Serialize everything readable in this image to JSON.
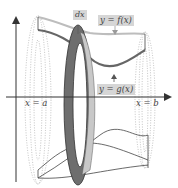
{
  "diagram": {
    "labels": {
      "dx": "dx",
      "upper_curve": "y = f(x)",
      "lower_curve": "y = g(x)",
      "left_bound": "x = a",
      "right_bound": "x = b"
    },
    "colors": {
      "axis": "#333333",
      "upper_curve": "#bdbdbd",
      "lower_curve": "#666666",
      "washer_dark": "#6e6e6e",
      "washer_light": "#c8c8c8",
      "surface_outline": "#444444",
      "dotted_ellipses": "#9a9a9a",
      "label_box": "#d6d6d6"
    }
  }
}
